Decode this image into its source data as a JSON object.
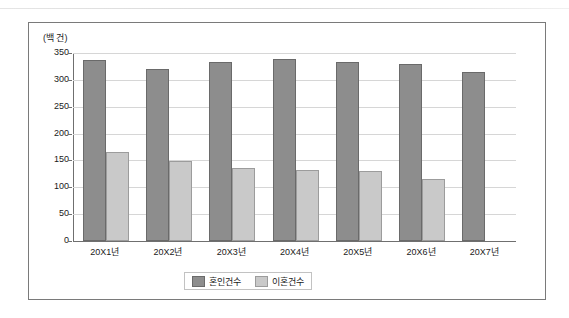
{
  "chart_data": {
    "type": "bar",
    "title": "",
    "unit_label": "(백 건)",
    "categories": [
      "20X1년",
      "20X2년",
      "20X3년",
      "20X4년",
      "20X5년",
      "20X6년",
      "20X7년"
    ],
    "series": [
      {
        "name": "혼인건수",
        "color": "#8d8d8d",
        "values": [
          333,
          316,
          330,
          336,
          330,
          325,
          311
        ]
      },
      {
        "name": "이혼건수",
        "color": "#c9c9c9",
        "values": [
          162,
          145,
          133,
          128,
          127,
          112,
          0
        ]
      }
    ],
    "xlabel": "",
    "ylabel": "",
    "ylim": [
      0,
      350
    ],
    "yticks": [
      0,
      50,
      100,
      150,
      200,
      250,
      300,
      350
    ],
    "ytick_labels": [
      "0",
      "50",
      "100",
      "150",
      "200",
      "250",
      "300",
      "350"
    ],
    "grid": true,
    "legend_position": "bottom"
  }
}
